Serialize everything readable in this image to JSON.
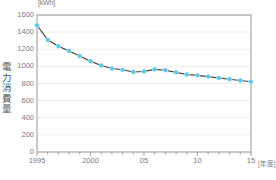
{
  "chart_data": {
    "type": "line",
    "title": "",
    "unit_label": "[kWh]",
    "ylabel": "電力消費量",
    "xlabel": "[年度]",
    "ylim": [
      0,
      1600
    ],
    "ytick_step": 200,
    "yticks": [
      0,
      200,
      400,
      600,
      800,
      1000,
      1200,
      1400,
      1600
    ],
    "ytick_labels": [
      "0",
      "200",
      "400",
      "600",
      "800",
      "1000",
      "1200",
      "1400",
      "1600"
    ],
    "xlim": [
      1995,
      2015
    ],
    "xticks_major": [
      1995,
      2000,
      2005,
      2010,
      2015
    ],
    "xtick_labels": [
      "1995",
      "2000",
      "05",
      "10",
      "15"
    ],
    "xticks_minor_every": 1,
    "grid": "horizontal",
    "legend": "none",
    "marker": "circle",
    "marker_color": "#5CC6E8",
    "line_color": "#3b3b3b",
    "categories": [
      1995,
      1996,
      1997,
      1998,
      1999,
      2000,
      2001,
      2002,
      2003,
      2004,
      2005,
      2006,
      2007,
      2008,
      2009,
      2010,
      2011,
      2012,
      2013,
      2014,
      2015
    ],
    "values": [
      1480,
      1310,
      1235,
      1180,
      1120,
      1060,
      1010,
      975,
      960,
      935,
      940,
      965,
      955,
      930,
      905,
      895,
      880,
      865,
      850,
      835,
      820
    ],
    "series": [
      {
        "name": "電力消費量",
        "values": [
          1480,
          1310,
          1235,
          1180,
          1120,
          1060,
          1010,
          975,
          960,
          935,
          940,
          965,
          955,
          930,
          905,
          895,
          880,
          865,
          850,
          835,
          820
        ]
      }
    ]
  },
  "plot": {
    "left": 37,
    "right": 251,
    "top": 15,
    "bottom": 152
  }
}
